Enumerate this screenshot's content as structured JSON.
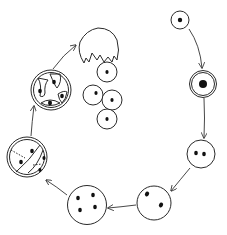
{
  "diagram": {
    "type": "life-cycle",
    "colors": {
      "stroke": "#2a2a2a",
      "nucleus": "#111111",
      "background": "#ffffff"
    },
    "stages": [
      {
        "id": "stage-1",
        "label": "",
        "nuclei": 1,
        "cx": 180,
        "cy": 20,
        "r": 9
      },
      {
        "id": "stage-2",
        "label": "",
        "nuclei": 1,
        "cx": 203,
        "cy": 84,
        "r": 13
      },
      {
        "id": "stage-3",
        "label": "",
        "nuclei": 2,
        "cx": 201,
        "cy": 154,
        "r": 14
      },
      {
        "id": "stage-4",
        "label": "",
        "nuclei": 2,
        "cx": 154,
        "cy": 202,
        "r": 17
      },
      {
        "id": "stage-5",
        "label": "",
        "nuclei": 4,
        "cx": 87,
        "cy": 205,
        "r": 19
      },
      {
        "id": "stage-6",
        "label": "",
        "nuclei": 4,
        "cx": 27,
        "cy": 157,
        "r": 20
      },
      {
        "id": "stage-7",
        "label": "",
        "nuclei": 5,
        "cx": 51,
        "cy": 90,
        "r": 20
      },
      {
        "id": "stage-8",
        "label": "",
        "nuclei": 4,
        "released_cells": 4
      }
    ],
    "arrows": [
      {
        "from": "stage-1",
        "to": "stage-2"
      },
      {
        "from": "stage-2",
        "to": "stage-3"
      },
      {
        "from": "stage-3",
        "to": "stage-4"
      },
      {
        "from": "stage-4",
        "to": "stage-5"
      },
      {
        "from": "stage-5",
        "to": "stage-6"
      },
      {
        "from": "stage-6",
        "to": "stage-7"
      },
      {
        "from": "stage-7",
        "to": "stage-8"
      }
    ]
  }
}
